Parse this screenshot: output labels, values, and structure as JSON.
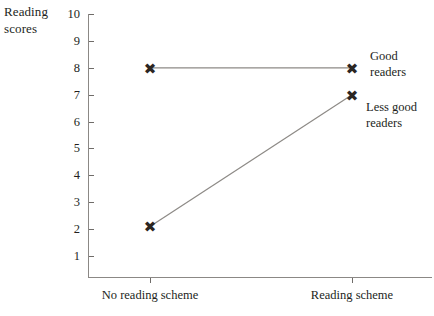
{
  "chart_data": {
    "type": "line",
    "title": "",
    "xlabel": "",
    "ylabel": "Reading\nscores",
    "categories": [
      "No reading scheme",
      "Reading scheme"
    ],
    "ylim": [
      0,
      10
    ],
    "yticks": [
      1,
      2,
      3,
      4,
      5,
      6,
      7,
      8,
      9,
      10
    ],
    "ytick_labels": [
      "1",
      "2",
      "3",
      "4",
      "5",
      "6",
      "7",
      "8",
      "9",
      "10"
    ],
    "grid": false,
    "legend_position": "inline-right",
    "marker": "cross",
    "series": [
      {
        "name": "Good readers",
        "label_lines": "Good readers",
        "values": [
          8,
          8
        ]
      },
      {
        "name": "Less good readers",
        "label_lines": "Less good\nreaders",
        "values": [
          2.1,
          7
        ]
      }
    ],
    "colors": {
      "marker": "#2b2622",
      "line": "#8d8a86",
      "axis": "#8b8885",
      "text": "#231f1c",
      "background": "#ffffff"
    }
  }
}
